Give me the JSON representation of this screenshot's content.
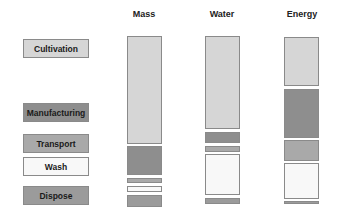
{
  "columns": [
    {
      "id": "mass",
      "label": "Mass",
      "x": 127
    },
    {
      "id": "water",
      "label": "Water",
      "x": 205
    },
    {
      "id": "energy",
      "label": "Energy",
      "x": 284
    }
  ],
  "legend": [
    {
      "label": "Cultivation",
      "color": "#d6d6d6",
      "top": 39
    },
    {
      "label": "Manufacturing",
      "color": "#8e8e8e",
      "top": 103
    },
    {
      "label": "Transport",
      "color": "#a9a9a9",
      "top": 134
    },
    {
      "label": "Wash",
      "color": "#f8f8f8",
      "top": 157
    },
    {
      "label": "Dispose",
      "color": "#9b9b9b",
      "top": 186
    }
  ],
  "segments": {
    "mass": [
      {
        "stage": "Cultivation",
        "top": 36,
        "bottom": 144
      },
      {
        "stage": "Manufacturing",
        "top": 146,
        "bottom": 175
      },
      {
        "stage": "Transport",
        "top": 178,
        "bottom": 183
      },
      {
        "stage": "Wash",
        "top": 186,
        "bottom": 192
      },
      {
        "stage": "Dispose",
        "top": 195,
        "bottom": 207
      }
    ],
    "water": [
      {
        "stage": "Cultivation",
        "top": 36,
        "bottom": 129
      },
      {
        "stage": "Manufacturing",
        "top": 132,
        "bottom": 143
      },
      {
        "stage": "Transport",
        "top": 146,
        "bottom": 152
      },
      {
        "stage": "Wash",
        "top": 154,
        "bottom": 195
      },
      {
        "stage": "Dispose",
        "top": 198,
        "bottom": 204
      }
    ],
    "energy": [
      {
        "stage": "Cultivation",
        "top": 37,
        "bottom": 86
      },
      {
        "stage": "Manufacturing",
        "top": 89,
        "bottom": 138
      },
      {
        "stage": "Transport",
        "top": 140,
        "bottom": 161
      },
      {
        "stage": "Wash",
        "top": 163,
        "bottom": 199
      },
      {
        "stage": "Dispose",
        "top": 201,
        "bottom": 204
      }
    ]
  }
}
